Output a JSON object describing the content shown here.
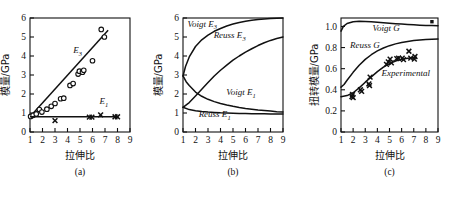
{
  "figure": {
    "panels": [
      {
        "caption": "(a)",
        "xlabel": "拉伸比",
        "ylabel": "模量/GPa",
        "xticks": [
          "1",
          "2",
          "3",
          "4",
          "5",
          "6",
          "7",
          "8",
          "9"
        ],
        "yticks": [
          "0",
          "1",
          "2",
          "3",
          "4",
          "5",
          "6"
        ],
        "annotations": [
          {
            "text": "E",
            "sub": "3",
            "x": 4.45,
            "y": 4.15
          },
          {
            "text": "E",
            "sub": "1",
            "x": 6.55,
            "y": 1.45
          }
        ]
      },
      {
        "caption": "(b)",
        "xlabel": "拉伸比",
        "ylabel": "模量/GPa",
        "xticks": [
          "1",
          "2",
          "3",
          "4",
          "5",
          "6",
          "7",
          "8",
          "9"
        ],
        "yticks": [
          "0",
          "1",
          "2",
          "3",
          "4",
          "5",
          "6"
        ],
        "annotations": [
          {
            "text": "Voigt E",
            "sub": "3",
            "x": 1.35,
            "y": 5.55
          },
          {
            "text": "Reuss E",
            "sub": "3",
            "x": 3.45,
            "y": 4.95
          },
          {
            "text": "Voigt E",
            "sub": "1",
            "x": 4.45,
            "y": 1.95
          },
          {
            "text": "Reuss E",
            "sub": "1",
            "x": 2.25,
            "y": 0.78
          }
        ]
      },
      {
        "caption": "(c)",
        "xlabel": "拉伸比",
        "ylabel": "扭转模量/GPa",
        "xticks": [
          "1",
          "2",
          "3",
          "4",
          "5",
          "6",
          "7",
          "8",
          "9"
        ],
        "yticks": [
          "0",
          "0.2",
          "0.4",
          "0.6",
          "0.8",
          "1.0"
        ],
        "annotations": [
          {
            "text": "Voigt G",
            "sub": "",
            "x": 3.6,
            "y": 0.955
          },
          {
            "text": "Reuss G",
            "sub": "",
            "x": 1.75,
            "y": 0.8
          },
          {
            "text": "Experimental",
            "sub": "",
            "x": 4.35,
            "y": 0.53
          }
        ]
      }
    ]
  },
  "chart_data": [
    {
      "type": "scatter",
      "title": "(a)",
      "xlabel": "拉伸比",
      "ylabel": "模量/GPa",
      "xlim": [
        1,
        9
      ],
      "ylim": [
        0,
        6
      ],
      "grid": false,
      "legend": "inline-annotations",
      "series": [
        {
          "name": "E3",
          "marker": "circle",
          "points": [
            [
              1.05,
              0.82
            ],
            [
              1.25,
              0.88
            ],
            [
              1.5,
              0.95
            ],
            [
              1.75,
              1.18
            ],
            [
              1.95,
              1.05
            ],
            [
              2.35,
              1.2
            ],
            [
              2.7,
              1.35
            ],
            [
              3.0,
              1.5
            ],
            [
              3.45,
              1.75
            ],
            [
              3.7,
              1.78
            ],
            [
              4.2,
              2.45
            ],
            [
              4.45,
              2.55
            ],
            [
              4.85,
              3.05
            ],
            [
              4.95,
              3.2
            ],
            [
              5.2,
              3.15
            ],
            [
              5.3,
              3.25
            ],
            [
              6.0,
              3.75
            ],
            [
              6.7,
              5.4
            ],
            [
              6.95,
              5.0
            ]
          ],
          "fit_line": [
            [
              1.0,
              0.8
            ],
            [
              7.25,
              5.35
            ]
          ]
        },
        {
          "name": "E1",
          "marker": "x",
          "points": [
            [
              3.0,
              0.6
            ],
            [
              5.75,
              0.78
            ],
            [
              5.95,
              0.78
            ],
            [
              6.65,
              0.9
            ],
            [
              7.8,
              0.8
            ],
            [
              8.0,
              0.8
            ]
          ],
          "fit_line": [
            [
              1.0,
              0.8
            ],
            [
              8.05,
              0.8
            ]
          ]
        }
      ]
    },
    {
      "type": "line",
      "title": "(b)",
      "xlabel": "拉伸比",
      "ylabel": "模量/GPa",
      "xlim": [
        1,
        9
      ],
      "ylim": [
        0,
        6
      ],
      "grid": false,
      "legend": "inline-annotations",
      "series": [
        {
          "name": "Voigt E3",
          "points": [
            [
              1.0,
              2.95
            ],
            [
              1.2,
              3.45
            ],
            [
              1.5,
              3.95
            ],
            [
              2.0,
              4.5
            ],
            [
              2.5,
              4.85
            ],
            [
              3.0,
              5.1
            ],
            [
              3.5,
              5.3
            ],
            [
              4.0,
              5.45
            ],
            [
              4.5,
              5.58
            ],
            [
              5.0,
              5.68
            ],
            [
              5.5,
              5.76
            ],
            [
              6.0,
              5.83
            ],
            [
              6.5,
              5.88
            ],
            [
              7.0,
              5.92
            ],
            [
              7.5,
              5.95
            ],
            [
              8.0,
              5.97
            ],
            [
              8.5,
              5.99
            ],
            [
              9.0,
              6.0
            ]
          ]
        },
        {
          "name": "Reuss E3",
          "points": [
            [
              1.0,
              1.3
            ],
            [
              1.5,
              1.55
            ],
            [
              2.0,
              1.9
            ],
            [
              2.5,
              2.25
            ],
            [
              3.0,
              2.6
            ],
            [
              3.5,
              2.95
            ],
            [
              4.0,
              3.25
            ],
            [
              4.5,
              3.52
            ],
            [
              5.0,
              3.78
            ],
            [
              5.5,
              4.0
            ],
            [
              6.0,
              4.2
            ],
            [
              6.5,
              4.38
            ],
            [
              7.0,
              4.55
            ],
            [
              7.5,
              4.7
            ],
            [
              8.0,
              4.82
            ],
            [
              8.5,
              4.92
            ],
            [
              9.0,
              5.0
            ]
          ]
        },
        {
          "name": "Voigt E1",
          "points": [
            [
              1.0,
              2.95
            ],
            [
              1.25,
              2.65
            ],
            [
              1.5,
              2.45
            ],
            [
              2.0,
              2.1
            ],
            [
              2.5,
              1.88
            ],
            [
              3.0,
              1.72
            ],
            [
              3.5,
              1.6
            ],
            [
              4.0,
              1.5
            ],
            [
              4.5,
              1.42
            ],
            [
              5.0,
              1.35
            ],
            [
              5.5,
              1.29
            ],
            [
              6.0,
              1.24
            ],
            [
              6.5,
              1.2
            ],
            [
              7.0,
              1.16
            ],
            [
              7.5,
              1.13
            ],
            [
              8.0,
              1.1
            ],
            [
              8.5,
              1.07
            ],
            [
              9.0,
              1.05
            ]
          ]
        },
        {
          "name": "Reuss E1",
          "points": [
            [
              1.0,
              1.3
            ],
            [
              1.5,
              1.18
            ],
            [
              2.0,
              1.12
            ],
            [
              2.5,
              1.08
            ],
            [
              3.0,
              1.05
            ],
            [
              3.5,
              1.03
            ],
            [
              4.0,
              1.01
            ],
            [
              4.5,
              1.0
            ],
            [
              5.0,
              0.99
            ],
            [
              5.5,
              0.98
            ],
            [
              6.0,
              0.97
            ],
            [
              6.5,
              0.965
            ],
            [
              7.0,
              0.96
            ],
            [
              7.5,
              0.955
            ],
            [
              8.0,
              0.95
            ],
            [
              8.5,
              0.948
            ],
            [
              9.0,
              0.945
            ]
          ]
        }
      ]
    },
    {
      "type": "line",
      "title": "(c)",
      "xlabel": "拉伸比",
      "ylabel": "扭转模量/GPa",
      "xlim": [
        1,
        9
      ],
      "ylim": [
        0,
        1.08
      ],
      "grid": false,
      "legend": "inline-annotations",
      "series": [
        {
          "name": "Voigt G",
          "points": [
            [
              1.0,
              0.955
            ],
            [
              1.2,
              1.0
            ],
            [
              1.5,
              1.028
            ],
            [
              2.0,
              1.045
            ],
            [
              2.5,
              1.05
            ],
            [
              3.0,
              1.048
            ],
            [
              3.5,
              1.044
            ],
            [
              4.0,
              1.04
            ],
            [
              4.5,
              1.035
            ],
            [
              5.0,
              1.03
            ],
            [
              5.5,
              1.026
            ],
            [
              6.0,
              1.022
            ],
            [
              6.5,
              1.018
            ],
            [
              7.0,
              1.015
            ],
            [
              7.5,
              1.012
            ],
            [
              8.0,
              1.01
            ],
            [
              8.5,
              1.008
            ],
            [
              9.0,
              1.006
            ]
          ]
        },
        {
          "name": "Reuss G",
          "points": [
            [
              1.0,
              0.425
            ],
            [
              1.25,
              0.45
            ],
            [
              1.5,
              0.49
            ],
            [
              2.0,
              0.565
            ],
            [
              2.5,
              0.632
            ],
            [
              3.0,
              0.688
            ],
            [
              3.5,
              0.732
            ],
            [
              4.0,
              0.768
            ],
            [
              4.5,
              0.796
            ],
            [
              5.0,
              0.818
            ],
            [
              5.5,
              0.835
            ],
            [
              6.0,
              0.848
            ],
            [
              6.5,
              0.858
            ],
            [
              7.0,
              0.866
            ],
            [
              7.5,
              0.872
            ],
            [
              8.0,
              0.876
            ],
            [
              8.5,
              0.879
            ],
            [
              9.0,
              0.881
            ]
          ]
        },
        {
          "name": "Experimental",
          "fit_points": [
            [
              1.0,
              0.335
            ],
            [
              1.5,
              0.345
            ],
            [
              2.0,
              0.372
            ],
            [
              2.5,
              0.418
            ],
            [
              3.0,
              0.472
            ],
            [
              3.5,
              0.522
            ],
            [
              4.0,
              0.572
            ],
            [
              4.5,
              0.615
            ],
            [
              5.0,
              0.648
            ],
            [
              5.5,
              0.672
            ],
            [
              6.0,
              0.688
            ],
            [
              6.5,
              0.698
            ],
            [
              7.0,
              0.703
            ],
            [
              7.2,
              0.705
            ]
          ],
          "marker": "x",
          "points": [
            [
              1.9,
              0.335
            ],
            [
              1.95,
              0.355
            ],
            [
              2.0,
              0.325
            ],
            [
              2.6,
              0.4
            ],
            [
              2.7,
              0.385
            ],
            [
              3.3,
              0.455
            ],
            [
              3.35,
              0.44
            ],
            [
              3.4,
              0.52
            ],
            [
              4.75,
              0.64
            ],
            [
              4.9,
              0.665
            ],
            [
              5.05,
              0.69
            ],
            [
              5.15,
              0.655
            ],
            [
              5.6,
              0.695
            ],
            [
              5.75,
              0.7
            ],
            [
              6.05,
              0.7
            ],
            [
              6.15,
              0.685
            ],
            [
              6.6,
              0.765
            ],
            [
              6.75,
              0.7
            ],
            [
              7.05,
              0.69
            ],
            [
              7.1,
              0.715
            ]
          ]
        },
        {
          "name": "marker-top-right",
          "marker": "square",
          "points": [
            [
              8.5,
              1.045
            ]
          ]
        }
      ]
    }
  ]
}
